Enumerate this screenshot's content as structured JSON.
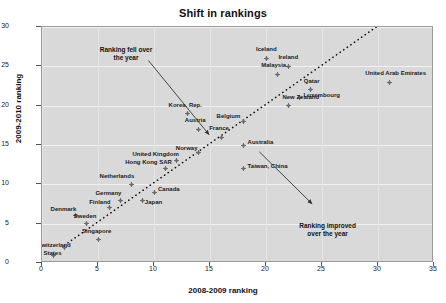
{
  "chart_data": {
    "type": "scatter",
    "title": "Shift in rankings",
    "xlabel": "2008-2009 ranking",
    "ylabel": "2009-2010 ranking",
    "xlim": [
      0,
      35
    ],
    "ylim": [
      0,
      30
    ],
    "xticks": [
      0,
      5,
      10,
      15,
      20,
      25,
      30,
      35
    ],
    "yticks": [
      0,
      5,
      10,
      15,
      20,
      25,
      30
    ],
    "grid": true,
    "legend": "none",
    "reference_line": {
      "style": "dotted",
      "description": "45-degree line y = x",
      "from": [
        2,
        2
      ],
      "to": [
        30,
        30
      ]
    },
    "annotations": [
      {
        "id": "fell",
        "line1": "Ranking fell over",
        "line2": "the year",
        "text_x": 7.5,
        "text_y": 27.0,
        "arrow_from": [
          9.6,
          25.6
        ],
        "arrow_to": [
          15.0,
          16.2
        ]
      },
      {
        "id": "improved",
        "line1": "Ranking improved",
        "line2": "over the year",
        "text_x": 25.5,
        "text_y": 4.6,
        "arrow_from": [
          19.5,
          14.0
        ],
        "arrow_to": [
          24.2,
          7.4
        ]
      }
    ],
    "points": [
      {
        "label": "United States",
        "x": 1,
        "y": 1,
        "lx": -30,
        "ly": -1
      },
      {
        "label": "Switzerland",
        "x": 2,
        "y": 2,
        "lx": -27,
        "ly": -1
      },
      {
        "label": "Singapore",
        "x": 5,
        "y": 3,
        "lx": -16,
        "ly": -7
      },
      {
        "label": "Sweden",
        "x": 4,
        "y": 5,
        "lx": -13,
        "ly": -7
      },
      {
        "label": "Denmark",
        "x": 3,
        "y": 6,
        "lx": -25,
        "ly": -6
      },
      {
        "label": "Finland",
        "x": 6,
        "y": 7,
        "lx": -20,
        "ly": -5
      },
      {
        "label": "Germany",
        "x": 7,
        "y": 8,
        "lx": -25,
        "ly": -6
      },
      {
        "label": "Japan",
        "x": 9,
        "y": 8,
        "lx": 2,
        "ly": 3
      },
      {
        "label": "Canada",
        "x": 10,
        "y": 9,
        "lx": 4,
        "ly": -2
      },
      {
        "label": "Netherlands",
        "x": 8,
        "y": 10,
        "lx": -32,
        "ly": -7
      },
      {
        "label": "Hong Kong SAR",
        "x": 11,
        "y": 12,
        "lx": -40,
        "ly": -6
      },
      {
        "label": "United Kingdom",
        "x": 12,
        "y": 13,
        "lx": -44,
        "ly": -6
      },
      {
        "label": "Korea, Rep.",
        "x": 13,
        "y": 19,
        "lx": -19,
        "ly": -8
      },
      {
        "label": "Austria",
        "x": 14,
        "y": 17,
        "lx": -14,
        "ly": -8
      },
      {
        "label": "France",
        "x": 16,
        "y": 16,
        "lx": -12,
        "ly": -8
      },
      {
        "label": "Norway",
        "x": 14,
        "y": 14,
        "lx": -23,
        "ly": -4
      },
      {
        "label": "Australia",
        "x": 18,
        "y": 15,
        "lx": 4,
        "ly": -2
      },
      {
        "label": "Taiwan, China",
        "x": 18,
        "y": 12,
        "lx": 4,
        "ly": -2
      },
      {
        "label": "Belgium",
        "x": 18,
        "y": 18,
        "lx": -27,
        "ly": -4
      },
      {
        "label": "New Zealand",
        "x": 22,
        "y": 20,
        "lx": -6,
        "ly": -8
      },
      {
        "label": "Luxembourg",
        "x": 23,
        "y": 21,
        "lx": 4,
        "ly": -2
      },
      {
        "label": "Qatar",
        "x": 24,
        "y": 22,
        "lx": -7,
        "ly": -8
      },
      {
        "label": "Malaysia",
        "x": 21,
        "y": 24,
        "lx": -16,
        "ly": -8
      },
      {
        "label": "Ireland",
        "x": 22,
        "y": 25,
        "lx": -10,
        "ly": -8
      },
      {
        "label": "Iceland",
        "x": 20,
        "y": 26,
        "lx": -10,
        "ly": -8
      },
      {
        "label": "United Arab Emirates",
        "x": 31,
        "y": 23,
        "lx": -24,
        "ly": -8
      }
    ]
  }
}
